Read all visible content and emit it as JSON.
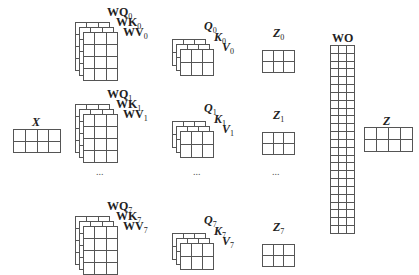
{
  "diagram": {
    "input": {
      "label": "X",
      "rows": 2,
      "cols": 4
    },
    "heads": [
      {
        "wq": "WQ",
        "wk": "WK",
        "wv": "WV",
        "q": "Q",
        "k": "K",
        "v": "V",
        "z": "Z",
        "index": "0"
      },
      {
        "wq": "WQ",
        "wk": "WK",
        "wv": "WV",
        "q": "Q",
        "k": "K",
        "v": "V",
        "z": "Z",
        "index": "1"
      },
      {
        "wq": "WQ",
        "wk": "WK",
        "wv": "WV",
        "q": "Q",
        "k": "K",
        "v": "V",
        "z": "Z",
        "index": "7"
      }
    ],
    "ellipsis": "...",
    "weight_stack": {
      "rows": 4,
      "cols": 3,
      "layers": 3
    },
    "qkv_stack": {
      "rows": 2,
      "cols": 3,
      "layers": 3
    },
    "z_head": {
      "rows": 2,
      "cols": 3
    },
    "output_weight": {
      "label": "WO",
      "rows": 24,
      "cols": 3
    },
    "output": {
      "label": "Z",
      "rows": 2,
      "cols": 4
    }
  }
}
